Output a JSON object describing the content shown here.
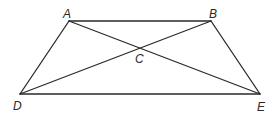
{
  "diagram": {
    "type": "geometry-figure",
    "points": {
      "A": {
        "label": "A",
        "x": 69,
        "y": 21,
        "label_x": 63,
        "label_y": 18
      },
      "B": {
        "label": "B",
        "x": 211,
        "y": 21,
        "label_x": 209,
        "label_y": 18
      },
      "C": {
        "label": "C",
        "x": 139,
        "y": 48,
        "label_x": 135,
        "label_y": 63
      },
      "D": {
        "label": "D",
        "x": 20,
        "y": 94,
        "label_x": 13,
        "label_y": 110
      },
      "E": {
        "label": "E",
        "x": 260,
        "y": 94,
        "label_x": 257,
        "label_y": 111
      }
    },
    "segments": [
      {
        "from": "A",
        "to": "B"
      },
      {
        "from": "A",
        "to": "D"
      },
      {
        "from": "B",
        "to": "E"
      },
      {
        "from": "D",
        "to": "E"
      },
      {
        "from": "A",
        "to": "E"
      },
      {
        "from": "B",
        "to": "D"
      }
    ],
    "stroke_color": "#2a2a2a"
  }
}
